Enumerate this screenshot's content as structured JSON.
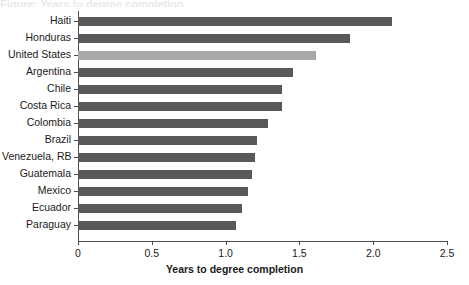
{
  "chart_data": {
    "type": "bar",
    "orientation": "horizontal",
    "title": "",
    "xlabel": "Years to degree completion",
    "ylabel": "",
    "xlim": [
      0,
      2.5
    ],
    "xticks": [
      "0",
      "0.5",
      "1.0",
      "1.5",
      "2.0",
      "2.5"
    ],
    "xtick_values": [
      0,
      0.5,
      1.0,
      1.5,
      2.0,
      2.5
    ],
    "grid": false,
    "legend": "none",
    "categories": [
      "Haiti",
      "Honduras",
      "United States",
      "Argentina",
      "Chile",
      "Costa Rica",
      "Colombia",
      "Brazil",
      "Venezuela, RB",
      "Guatemala",
      "Mexico",
      "Ecuador",
      "Paraguay"
    ],
    "values": [
      2.13,
      1.84,
      1.61,
      1.46,
      1.38,
      1.38,
      1.29,
      1.21,
      1.2,
      1.18,
      1.15,
      1.11,
      1.07
    ],
    "highlight_category": "United States",
    "colors": {
      "bar": "#595959",
      "bar_highlight": "#a9a9a9",
      "axis": "#4d4d4d",
      "text": "#1a1a1a",
      "background": "#ffffff"
    }
  },
  "clipped_title_text": "Figure: Years to degree completion"
}
